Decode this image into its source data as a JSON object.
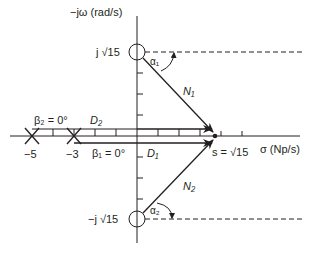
{
  "figure": {
    "type": "pole-zero s-plane diagram",
    "vertical_axis_label": "−jω (rad/s)",
    "horizontal_axis_label": "σ (Np/s)",
    "zero_upper_label": "j √15",
    "zero_lower_label": "−j √15",
    "pole_1_label": "−5",
    "pole_2_label": "−3",
    "beta2_label": "β₂ = 0°",
    "beta1_label": "β₁ = 0°",
    "d2_label": "D₂",
    "d1_label": "D₁",
    "n1_label": "N₁",
    "n2_label": "N₂",
    "alpha1_label": "α₁",
    "alpha2_label": "α₂",
    "point_label": "s = √15",
    "poles": [
      -5,
      -3
    ],
    "zeros": [
      "j√15",
      "-j√15"
    ],
    "evaluation_point": "√15"
  }
}
